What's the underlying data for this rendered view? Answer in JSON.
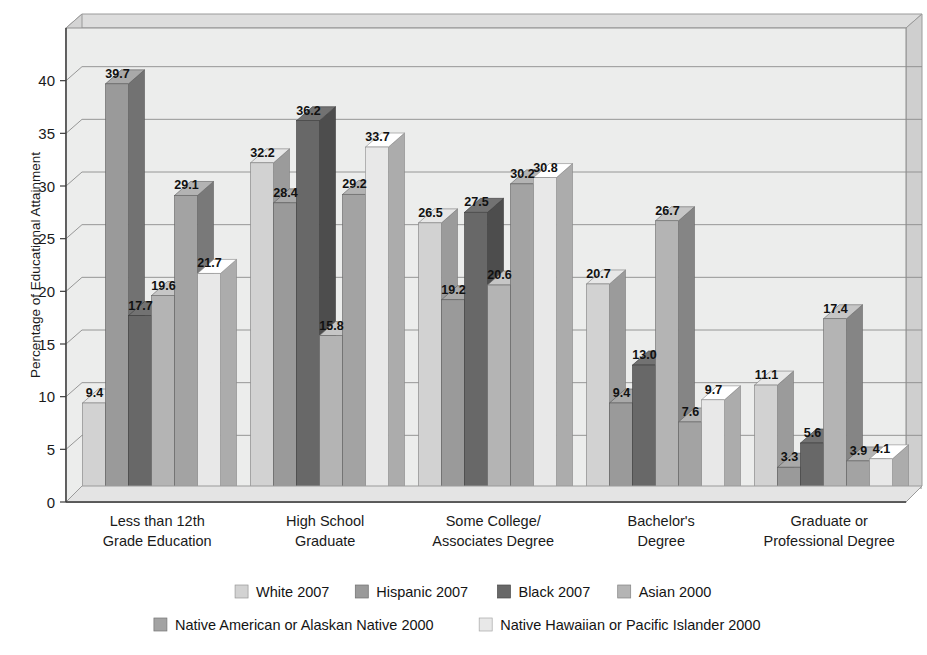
{
  "chart_data": {
    "type": "bar",
    "title": "",
    "subtitle": "",
    "xlabel": "",
    "ylabel": "Percentage of Educational Attainment",
    "ylim": [
      0,
      45
    ],
    "y_ticks": [
      0,
      5,
      10,
      15,
      20,
      25,
      30,
      35,
      40
    ],
    "y_tick_labels": [
      "0",
      "5",
      "10",
      "15",
      "20",
      "25",
      "30",
      "35",
      "40"
    ],
    "grid": true,
    "grid_axis": "y",
    "legend_position": "bottom",
    "three_d": true,
    "value_labels": true,
    "categories": [
      "Less than 12th Grade Education",
      "High School Graduate",
      "Some College/Associates Degree",
      "Bachelor's Degree",
      "Graduate or Professional Degree"
    ],
    "category_lines": [
      [
        "Less than 12th",
        "Grade Education"
      ],
      [
        "High School",
        "Graduate"
      ],
      [
        "Some College/",
        "Associates Degree"
      ],
      [
        "Bachelor's",
        "Degree"
      ],
      [
        "Graduate or",
        "Professional Degree"
      ]
    ],
    "series": [
      {
        "name": "White 2007",
        "color": "#d2d2d2",
        "values": [
          9.4,
          32.2,
          26.5,
          20.7,
          11.1
        ],
        "labels": [
          "9.4",
          "32.2",
          "26.5",
          "20.7",
          "11.1"
        ]
      },
      {
        "name": "Hispanic 2007",
        "color": "#9a9a9a",
        "values": [
          39.7,
          28.4,
          19.2,
          9.4,
          3.3
        ],
        "labels": [
          "39.7",
          "28.4",
          "19.2",
          "9.4",
          "3.3"
        ]
      },
      {
        "name": "Black 2007",
        "color": "#686868",
        "values": [
          17.7,
          36.2,
          27.5,
          13.0,
          5.6
        ],
        "labels": [
          "17.7",
          "36.2",
          "27.5",
          "13.0",
          "5.6"
        ]
      },
      {
        "name": "Asian 2000",
        "color": "#b4b4b4",
        "values": [
          19.6,
          15.8,
          20.6,
          26.7,
          17.4
        ],
        "labels": [
          "19.6",
          "15.8",
          "20.6",
          "26.7",
          "17.4"
        ]
      },
      {
        "name": "Native American or Alaskan Native 2000",
        "color": "#a3a3a3",
        "values": [
          29.1,
          29.2,
          30.2,
          7.6,
          3.9
        ],
        "labels": [
          "29.1",
          "29.2",
          "30.2",
          "7.6",
          "3.9"
        ]
      },
      {
        "name": "Native Hawaiian or Pacific Islander 2000",
        "color": "#e8e8e8",
        "values": [
          21.7,
          33.7,
          30.8,
          9.7,
          4.1
        ],
        "labels": [
          "21.7",
          "33.7",
          "30.8",
          "9.7",
          "4.1"
        ]
      }
    ]
  },
  "legend": {
    "row1": [
      "White 2007",
      "Hispanic 2007",
      "Black 2007",
      "Asian 2000"
    ],
    "row2": [
      "Native American or Alaskan Native 2000",
      "Native Hawaiian or Pacific Islander 2000"
    ]
  },
  "colors": {
    "plot_background": "#eceded",
    "wall_top": "#dcdcdc",
    "wall_side": "#d6d6d6",
    "floor": "#e2e2e2",
    "gridline": "#8c8c8c",
    "axis": "#3c3c3c",
    "text": "#1a1a1a"
  }
}
